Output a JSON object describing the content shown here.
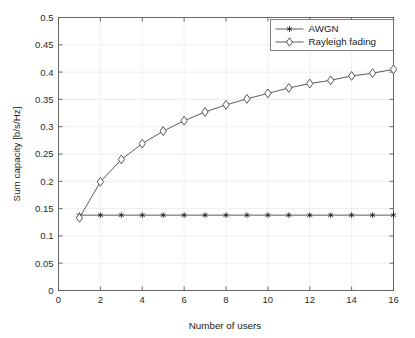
{
  "chart_data": {
    "type": "line",
    "title": "",
    "xlabel": "Number of users",
    "ylabel": "Sum capacity [b/s/Hz]",
    "xlim": [
      0,
      16
    ],
    "ylim": [
      0,
      0.5
    ],
    "xticks": [
      0,
      2,
      4,
      6,
      8,
      10,
      12,
      14,
      16
    ],
    "xtick_labels": [
      "0",
      "2",
      "4",
      "6",
      "8",
      "10",
      "12",
      "14",
      "16"
    ],
    "yticks": [
      0,
      0.05,
      0.1,
      0.15,
      0.2,
      0.25,
      0.3,
      0.35,
      0.4,
      0.45,
      0.5
    ],
    "ytick_labels": [
      "0",
      "0.05",
      "0.1",
      "0.15",
      "0.2",
      "0.25",
      "0.3",
      "0.35",
      "0.4",
      "0.45",
      "0.5"
    ],
    "grid": true,
    "legend_position": "upper right",
    "x": [
      1,
      2,
      3,
      4,
      5,
      6,
      7,
      8,
      9,
      10,
      11,
      12,
      13,
      14,
      15,
      16
    ],
    "series": [
      {
        "name": "AWGN",
        "marker": "star-asterisk",
        "values": [
          0.138,
          0.138,
          0.138,
          0.138,
          0.138,
          0.138,
          0.138,
          0.138,
          0.138,
          0.138,
          0.138,
          0.138,
          0.138,
          0.138,
          0.138,
          0.138
        ]
      },
      {
        "name": "Rayleigh fading",
        "marker": "open-diamond",
        "values": [
          0.133,
          0.199,
          0.24,
          0.269,
          0.292,
          0.311,
          0.327,
          0.34,
          0.351,
          0.361,
          0.371,
          0.379,
          0.385,
          0.393,
          0.398,
          0.405
        ]
      }
    ],
    "colors": {
      "line": "#4a4a4a",
      "grid": "#e8e8ec",
      "axis": "#5a5a5a",
      "text": "#1a1a1a",
      "background": "#ffffff"
    }
  },
  "legend": {
    "entries": [
      {
        "label": "AWGN"
      },
      {
        "label": "Rayleigh fading"
      }
    ]
  },
  "axes": {
    "x_title": "Number of users",
    "y_title": "Sum capacity [b/s/Hz]"
  }
}
